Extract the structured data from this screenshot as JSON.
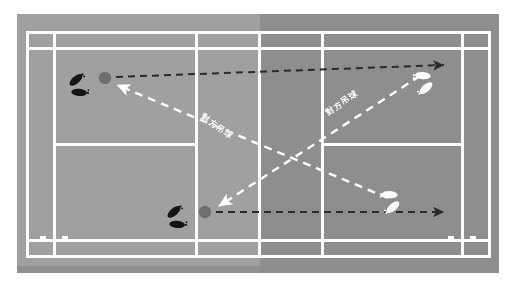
{
  "diagram": {
    "canvas": {
      "width": 516,
      "height": 289
    },
    "background_color": "#ffffff"
  },
  "court": {
    "outer_surround_color": "#9a9a9a",
    "near_half_color": "#a0a0a0",
    "far_half_color": "#8e8e8e",
    "line_color": "#fdfdfd",
    "bottom_shadow_color": "#8a8a8a",
    "orientation": "horizontal",
    "net_position_label": "center",
    "regions": [
      {
        "name": "left-back-doubles-alley"
      },
      {
        "name": "left-back-singles-court"
      },
      {
        "name": "left-service-court-top"
      },
      {
        "name": "left-service-court-bottom"
      },
      {
        "name": "right-service-court-top"
      },
      {
        "name": "right-service-court-bottom"
      },
      {
        "name": "right-back-singles-court"
      },
      {
        "name": "right-back-doubles-alley"
      },
      {
        "name": "top-sideline-alley"
      },
      {
        "name": "bottom-sideline-alley"
      }
    ]
  },
  "markers": {
    "shuttle_color": "#6e6e6e",
    "shuttles": [
      {
        "name": "shuttle-top-left",
        "x": 105,
        "y": 78,
        "r": 6
      },
      {
        "name": "shuttle-bottom-left",
        "x": 205,
        "y": 212,
        "r": 6
      }
    ],
    "footprints": [
      {
        "name": "footprints-player-top-left",
        "color": "#141414",
        "x": 78,
        "y": 86,
        "rotation": -20
      },
      {
        "name": "footprints-player-bottom-left",
        "color": "#141414",
        "x": 176,
        "y": 218,
        "rotation": -20
      },
      {
        "name": "footprints-opponent-top-right",
        "color": "#fbfbfb",
        "x": 424,
        "y": 82,
        "rotation": 160
      },
      {
        "name": "footprints-opponent-bottom-right",
        "color": "#fbfbfb",
        "x": 391,
        "y": 201,
        "rotation": 160
      }
    ]
  },
  "shots": [
    {
      "name": "clear-shot-top",
      "style": "dashed",
      "color": "#2b2b2b",
      "description": "player clear from top-left to opponent far right",
      "from": {
        "x": 116,
        "y": 77
      },
      "to": {
        "x": 447,
        "y": 65
      },
      "arrowhead": "end"
    },
    {
      "name": "clear-shot-bottom",
      "style": "dashed",
      "color": "#2b2b2b",
      "description": "player clear from bottom-left to opponent far right",
      "from": {
        "x": 216,
        "y": 212
      },
      "to": {
        "x": 447,
        "y": 212
      },
      "arrowhead": "end"
    },
    {
      "name": "opponent-drop-to-top-left",
      "style": "dashed",
      "color": "#ffffff",
      "label": "對方吊球",
      "description": "opponent drop shot landing near top-left player",
      "from": {
        "x": 388,
        "y": 198
      },
      "to": {
        "x": 113,
        "y": 84
      },
      "arrowhead": "end"
    },
    {
      "name": "opponent-drop-to-bottom-left",
      "style": "dashed",
      "color": "#ffffff",
      "label": "對方吊球",
      "description": "opponent drop shot landing near bottom-left player",
      "from": {
        "x": 420,
        "y": 76
      },
      "to": {
        "x": 215,
        "y": 208
      },
      "arrowhead": "end"
    }
  ],
  "labels": {
    "drop_shot_left": "對方吊球",
    "drop_shot_right": "對方吊球"
  }
}
